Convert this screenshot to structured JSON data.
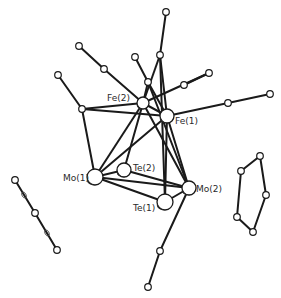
{
  "diagram": {
    "width": 281,
    "height": 298,
    "colors": {
      "bond": "#1a1a1a",
      "atom_fill": "#ffffff",
      "label": "#2a2a2a"
    },
    "labels": [
      {
        "id": "fe2",
        "text": "Fe(2)",
        "x": 107,
        "y": 101
      },
      {
        "id": "fe1",
        "text": "Fe(1)",
        "x": 175,
        "y": 124
      },
      {
        "id": "mo1",
        "text": "Mo(1)",
        "x": 63,
        "y": 181
      },
      {
        "id": "te2",
        "text": "Te(2)",
        "x": 133,
        "y": 171
      },
      {
        "id": "mo2",
        "text": "Mo(2)",
        "x": 196,
        "y": 192
      },
      {
        "id": "te1",
        "text": "Te(1)",
        "x": 133,
        "y": 211
      }
    ],
    "metal_atoms": [
      {
        "id": "fe2",
        "x": 143,
        "y": 103,
        "r": 6
      },
      {
        "id": "fe1",
        "x": 167,
        "y": 116,
        "r": 7
      },
      {
        "id": "mo1",
        "x": 95,
        "y": 177,
        "r": 8
      },
      {
        "id": "te2",
        "x": 124,
        "y": 170,
        "r": 7
      },
      {
        "id": "mo2",
        "x": 189,
        "y": 188,
        "r": 7
      },
      {
        "id": "te1",
        "x": 165,
        "y": 202,
        "r": 8
      }
    ],
    "small_atoms": [
      {
        "x": 82,
        "y": 109
      },
      {
        "x": 58,
        "y": 75
      },
      {
        "x": 104,
        "y": 69
      },
      {
        "x": 79,
        "y": 46
      },
      {
        "x": 148,
        "y": 82
      },
      {
        "x": 135,
        "y": 57
      },
      {
        "x": 160,
        "y": 55
      },
      {
        "x": 166,
        "y": 12
      },
      {
        "x": 184,
        "y": 85
      },
      {
        "x": 209,
        "y": 73
      },
      {
        "x": 228,
        "y": 103
      },
      {
        "x": 270,
        "y": 94
      },
      {
        "x": 160,
        "y": 251
      },
      {
        "x": 148,
        "y": 287
      },
      {
        "x": 15,
        "y": 180
      },
      {
        "x": 35,
        "y": 213
      },
      {
        "x": 57,
        "y": 250
      },
      {
        "x": 260,
        "y": 156
      },
      {
        "x": 241,
        "y": 171
      },
      {
        "x": 266,
        "y": 195
      },
      {
        "x": 237,
        "y": 217
      },
      {
        "x": 253,
        "y": 232
      }
    ],
    "bonds": [
      [
        82,
        109,
        143,
        103
      ],
      [
        82,
        109,
        167,
        116
      ],
      [
        82,
        109,
        58,
        75
      ],
      [
        82,
        109,
        95,
        177
      ],
      [
        143,
        103,
        104,
        69
      ],
      [
        104,
        69,
        79,
        46
      ],
      [
        143,
        103,
        167,
        116
      ],
      [
        143,
        103,
        95,
        177
      ],
      [
        143,
        103,
        124,
        170
      ],
      [
        143,
        103,
        189,
        188
      ],
      [
        143,
        103,
        209,
        73
      ],
      [
        167,
        116,
        95,
        177
      ],
      [
        167,
        116,
        189,
        188
      ],
      [
        167,
        116,
        165,
        202
      ],
      [
        167,
        116,
        228,
        103
      ],
      [
        228,
        103,
        270,
        94
      ],
      [
        148,
        82,
        135,
        57
      ],
      [
        148,
        82,
        167,
        116
      ],
      [
        148,
        82,
        143,
        103
      ],
      [
        148,
        82,
        189,
        188
      ],
      [
        160,
        55,
        166,
        12
      ],
      [
        160,
        55,
        143,
        103
      ],
      [
        160,
        55,
        167,
        116
      ],
      [
        160,
        55,
        165,
        202
      ],
      [
        184,
        85,
        209,
        73
      ],
      [
        95,
        177,
        124,
        170
      ],
      [
        95,
        177,
        189,
        188
      ],
      [
        95,
        177,
        165,
        202
      ],
      [
        124,
        170,
        189,
        188
      ],
      [
        165,
        202,
        189,
        188
      ],
      [
        189,
        188,
        160,
        251
      ],
      [
        160,
        251,
        148,
        287
      ],
      [
        15,
        180,
        35,
        213
      ],
      [
        35,
        213,
        57,
        250
      ],
      [
        260,
        156,
        241,
        171
      ],
      [
        241,
        171,
        237,
        217
      ],
      [
        237,
        217,
        253,
        232
      ],
      [
        253,
        232,
        266,
        195
      ],
      [
        266,
        195,
        260,
        156
      ]
    ],
    "mini_ellipses": [
      {
        "x": 24,
        "y": 195
      },
      {
        "x": 47,
        "y": 233
      }
    ]
  }
}
